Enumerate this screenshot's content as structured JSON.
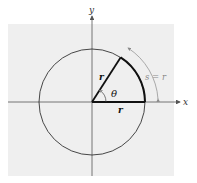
{
  "diagram": {
    "type": "radian-definition",
    "axes": {
      "x_label": "x",
      "y_label": "y"
    },
    "labels": {
      "radius_terminal": "r",
      "radius_initial": "r",
      "angle": "θ",
      "arc_length": "s = r"
    },
    "colors": {
      "background_panel": "#efefef",
      "axis": "#555555",
      "circle": "#333333",
      "bold_lines": "#111111",
      "arc_annotation": "#8a8a8a"
    }
  }
}
